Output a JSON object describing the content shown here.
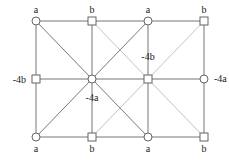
{
  "diagram": {
    "colors": {
      "dark_edge": "#777777",
      "light_edge": "#c4c4c4",
      "node_stroke": "#555555"
    },
    "nodes": [
      {
        "id": "n00",
        "x": 36,
        "y": 21,
        "shape": "circle",
        "label": "a",
        "lx": 36,
        "ly": 13,
        "anchor": "middle"
      },
      {
        "id": "n10",
        "x": 92,
        "y": 21,
        "shape": "square",
        "label": "b",
        "lx": 92,
        "ly": 13,
        "anchor": "middle"
      },
      {
        "id": "n20",
        "x": 148,
        "y": 21,
        "shape": "circle",
        "label": "a",
        "lx": 148,
        "ly": 13,
        "anchor": "middle"
      },
      {
        "id": "n30",
        "x": 204,
        "y": 21,
        "shape": "square",
        "label": "b",
        "lx": 204,
        "ly": 13,
        "anchor": "middle"
      },
      {
        "id": "n01",
        "x": 36,
        "y": 79,
        "shape": "square",
        "label": "-4b",
        "lx": 26,
        "ly": 83,
        "anchor": "end"
      },
      {
        "id": "n11",
        "x": 92,
        "y": 79,
        "shape": "circle",
        "label": "-4a",
        "lx": 92,
        "ly": 101,
        "anchor": "middle"
      },
      {
        "id": "n21",
        "x": 148,
        "y": 79,
        "shape": "square",
        "label": "-4b",
        "lx": 148,
        "ly": 60,
        "anchor": "middle"
      },
      {
        "id": "n31",
        "x": 204,
        "y": 79,
        "shape": "circle",
        "label": "-4a",
        "lx": 214,
        "ly": 82,
        "anchor": "start"
      },
      {
        "id": "n02",
        "x": 36,
        "y": 137,
        "shape": "circle",
        "label": "a",
        "lx": 36,
        "ly": 152,
        "anchor": "middle"
      },
      {
        "id": "n12",
        "x": 92,
        "y": 137,
        "shape": "square",
        "label": "b",
        "lx": 92,
        "ly": 152,
        "anchor": "middle"
      },
      {
        "id": "n22",
        "x": 148,
        "y": 137,
        "shape": "circle",
        "label": "a",
        "lx": 148,
        "ly": 152,
        "anchor": "middle"
      },
      {
        "id": "n32",
        "x": 204,
        "y": 137,
        "shape": "square",
        "label": "b",
        "lx": 204,
        "ly": 152,
        "anchor": "middle"
      }
    ],
    "edges": [
      {
        "from": "n00",
        "to": "n30",
        "tone": "dark"
      },
      {
        "from": "n01",
        "to": "n31",
        "tone": "dark"
      },
      {
        "from": "n02",
        "to": "n32",
        "tone": "dark"
      },
      {
        "from": "n00",
        "to": "n02",
        "tone": "dark"
      },
      {
        "from": "n10",
        "to": "n12",
        "tone": "dark"
      },
      {
        "from": "n20",
        "to": "n22",
        "tone": "dark"
      },
      {
        "from": "n30",
        "to": "n32",
        "tone": "dark"
      },
      {
        "from": "n00",
        "to": "n11",
        "tone": "dark"
      },
      {
        "from": "n11",
        "to": "n22",
        "tone": "dark"
      },
      {
        "from": "n02",
        "to": "n11",
        "tone": "dark"
      },
      {
        "from": "n11",
        "to": "n20",
        "tone": "dark"
      },
      {
        "from": "n10",
        "to": "n21",
        "tone": "light"
      },
      {
        "from": "n21",
        "to": "n32",
        "tone": "light"
      },
      {
        "from": "n12",
        "to": "n21",
        "tone": "light"
      },
      {
        "from": "n21",
        "to": "n30",
        "tone": "light"
      }
    ]
  }
}
